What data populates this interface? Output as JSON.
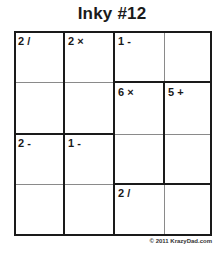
{
  "puzzle": {
    "title": "Inky #12",
    "size": 4,
    "cages": [
      {
        "clue": "2 /",
        "cells": [
          [
            0,
            0
          ],
          [
            1,
            0
          ]
        ]
      },
      {
        "clue": "2 ×",
        "cells": [
          [
            0,
            1
          ],
          [
            1,
            1
          ]
        ]
      },
      {
        "clue": "1 -",
        "cells": [
          [
            0,
            2
          ],
          [
            0,
            3
          ]
        ]
      },
      {
        "clue": "6 ×",
        "cells": [
          [
            1,
            2
          ],
          [
            2,
            2
          ]
        ]
      },
      {
        "clue": "5 +",
        "cells": [
          [
            1,
            3
          ],
          [
            2,
            3
          ]
        ]
      },
      {
        "clue": "2 -",
        "cells": [
          [
            2,
            0
          ],
          [
            3,
            0
          ]
        ]
      },
      {
        "clue": "1 -",
        "cells": [
          [
            2,
            1
          ],
          [
            3,
            1
          ]
        ]
      },
      {
        "clue": "2 /",
        "cells": [
          [
            3,
            2
          ],
          [
            3,
            3
          ]
        ]
      }
    ],
    "clues": {
      "c1": "2 /",
      "c2": "2 ×",
      "c3": "1 -",
      "c4": "6 ×",
      "c5": "5 +",
      "c6": "2 -",
      "c7": "1 -",
      "c8": "2 /"
    }
  },
  "footer": {
    "copyright": "© 2011 KrazyDad.com"
  }
}
